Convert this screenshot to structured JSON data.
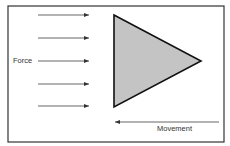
{
  "diagram": {
    "labels": {
      "force": "Force",
      "movement": "Movement"
    },
    "colors": {
      "border": "#333333",
      "triangle_fill": "#c4c4c4",
      "triangle_stroke": "#111111",
      "arrow": "#555555",
      "text": "#333333"
    },
    "frame": {
      "x": 8,
      "y": 6,
      "width": 216,
      "height": 136
    },
    "triangle": {
      "points": [
        [
          114,
          15
        ],
        [
          201,
          61
        ],
        [
          114,
          107
        ]
      ]
    },
    "force_arrows": [
      {
        "x1": 38,
        "x2": 89,
        "y": 15
      },
      {
        "x1": 38,
        "x2": 89,
        "y": 38
      },
      {
        "x1": 38,
        "x2": 89,
        "y": 61
      },
      {
        "x1": 38,
        "x2": 89,
        "y": 84
      },
      {
        "x1": 38,
        "x2": 89,
        "y": 106
      }
    ],
    "movement_arrow": {
      "x1": 219,
      "x2": 115,
      "y": 122,
      "direction": "left"
    }
  }
}
